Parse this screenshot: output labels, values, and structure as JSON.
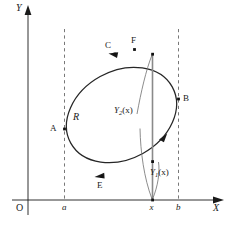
{
  "figure": {
    "kind": "math-diagram",
    "colors": {
      "stroke": "#1a1a1a",
      "curve": "#262626",
      "dashed": "#555555",
      "leader": "#6e6e6e",
      "chord": "#8a8a8a",
      "background": "#ffffff"
    },
    "axes": {
      "x_label": "X",
      "y_label": "Y",
      "origin_label": "O"
    },
    "ticks": [
      {
        "name": "a",
        "label": "a"
      },
      {
        "name": "x",
        "label": "x"
      },
      {
        "name": "b",
        "label": "b"
      }
    ],
    "region_label": "R",
    "boundary_points": [
      {
        "name": "A",
        "label": "A"
      },
      {
        "name": "B",
        "label": "B"
      },
      {
        "name": "C",
        "label": "C"
      },
      {
        "name": "E",
        "label": "E"
      },
      {
        "name": "F",
        "label": "F"
      }
    ],
    "functions": [
      {
        "name": "upper",
        "base": "Y",
        "sub": "2",
        "arg": "(x)",
        "label": "Y2(x)"
      },
      {
        "name": "lower",
        "base": "Y",
        "sub": "1",
        "arg": "(x)",
        "label": "Y1(x)"
      }
    ],
    "orientation": "counterclockwise"
  }
}
